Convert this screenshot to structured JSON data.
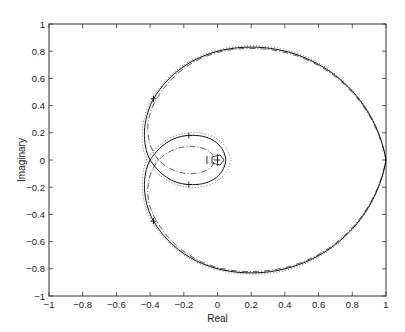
{
  "chart_data": {
    "type": "line",
    "title": "",
    "xlabel": "Real",
    "ylabel": "Imaginary",
    "xlim": [
      -1,
      1
    ],
    "ylim": [
      -1,
      1
    ],
    "grid": false,
    "legend": null,
    "xticks": [
      "-1",
      "-0.8",
      "-0.6",
      "-0.4",
      "-0.2",
      "0",
      "0.2",
      "0.4",
      "0.6",
      "0.8",
      "1"
    ],
    "yticks": [
      "1",
      "0.8",
      "0.6",
      "0.4",
      "0.2",
      "0",
      "-0.2",
      "-0.4",
      "-0.6",
      "-0.8",
      "-1"
    ],
    "series": [
      {
        "name": "solid",
        "style": "solid",
        "points": [
          [
            -0.4,
            0
          ],
          [
            -0.44,
            0.2
          ],
          [
            -0.38,
            0.45
          ],
          [
            -0.2,
            0.72
          ],
          [
            0.2,
            0.83
          ],
          [
            0.6,
            0.68
          ],
          [
            0.9,
            0.38
          ],
          [
            1.0,
            0
          ],
          [
            0.9,
            -0.38
          ],
          [
            0.6,
            -0.68
          ],
          [
            0.2,
            -0.83
          ],
          [
            -0.2,
            -0.72
          ],
          [
            -0.38,
            -0.45
          ],
          [
            -0.44,
            -0.2
          ],
          [
            -0.4,
            0
          ],
          [
            -0.17,
            0.18
          ],
          [
            0.03,
            0.1
          ],
          [
            0.05,
            0
          ],
          [
            0.03,
            -0.1
          ],
          [
            -0.17,
            -0.18
          ],
          [
            -0.4,
            0
          ]
        ]
      },
      {
        "name": "dash-dot",
        "style": "dashdot",
        "points": [
          [
            -0.35,
            0
          ],
          [
            -0.42,
            0.2
          ],
          [
            -0.36,
            0.45
          ],
          [
            0.2,
            0.82
          ],
          [
            1.0,
            0
          ],
          [
            0.2,
            -0.82
          ],
          [
            -0.36,
            -0.45
          ],
          [
            -0.42,
            -0.2
          ],
          [
            -0.35,
            0
          ],
          [
            -0.15,
            0.1
          ],
          [
            0.0,
            0.05
          ],
          [
            0.02,
            0
          ],
          [
            0.0,
            -0.05
          ],
          [
            -0.15,
            -0.1
          ],
          [
            -0.35,
            0
          ]
        ]
      },
      {
        "name": "dotted",
        "style": "dotted",
        "points": [
          [
            -0.42,
            0
          ],
          [
            -0.45,
            0.2
          ],
          [
            -0.39,
            0.45
          ],
          [
            0.2,
            0.84
          ],
          [
            1.0,
            0
          ],
          [
            0.2,
            -0.84
          ],
          [
            -0.39,
            -0.45
          ],
          [
            -0.45,
            -0.2
          ],
          [
            -0.42,
            0
          ],
          [
            -0.17,
            0.2
          ],
          [
            0.05,
            0.12
          ],
          [
            0.08,
            0
          ],
          [
            0.05,
            -0.12
          ],
          [
            -0.17,
            -0.2
          ],
          [
            -0.42,
            0
          ]
        ]
      }
    ],
    "markers": [
      [
        -0.38,
        0.45
      ],
      [
        -0.38,
        -0.45
      ],
      [
        -0.17,
        0.18
      ],
      [
        -0.17,
        -0.18
      ],
      [
        0,
        0
      ]
    ]
  }
}
